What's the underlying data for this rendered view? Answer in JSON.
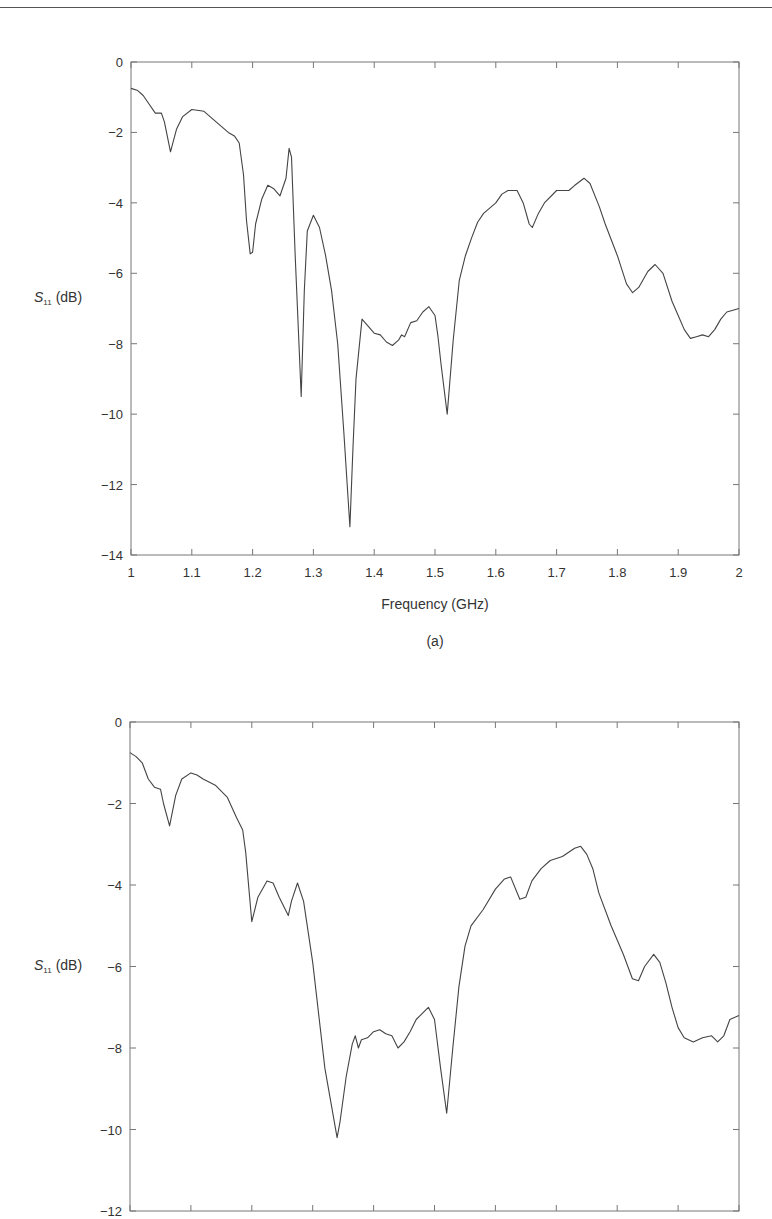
{
  "page": {
    "header_text": "Design for Large Frequency Ratio and Broadband"
  },
  "chart_data": [
    {
      "type": "line",
      "caption": "(a)",
      "title": "",
      "xlabel": "Frequency (GHz)",
      "ylabel": "S11 (dB)",
      "ylabel_main": "S",
      "ylabel_sub": "11",
      "ylabel_unit": "(dB)",
      "xlim": [
        1,
        2
      ],
      "ylim": [
        -14,
        0
      ],
      "grid": false,
      "xticks": [
        "1",
        "1.1",
        "1.2",
        "1.3",
        "1.4",
        "1.5",
        "1.6",
        "1.7",
        "1.8",
        "1.9",
        "2"
      ],
      "yticks": [
        "0",
        "−2",
        "−4",
        "−6",
        "−8",
        "−10",
        "−12",
        "−14"
      ],
      "series": [
        {
          "name": "S11",
          "x": [
            1.0,
            1.01,
            1.02,
            1.03,
            1.04,
            1.05,
            1.055,
            1.065,
            1.075,
            1.085,
            1.1,
            1.12,
            1.14,
            1.16,
            1.17,
            1.178,
            1.185,
            1.19,
            1.196,
            1.2,
            1.205,
            1.215,
            1.225,
            1.235,
            1.245,
            1.255,
            1.26,
            1.264,
            1.27,
            1.275,
            1.28,
            1.285,
            1.29,
            1.3,
            1.31,
            1.32,
            1.33,
            1.34,
            1.35,
            1.36,
            1.365,
            1.37,
            1.38,
            1.39,
            1.4,
            1.41,
            1.42,
            1.43,
            1.44,
            1.445,
            1.45,
            1.46,
            1.47,
            1.48,
            1.49,
            1.5,
            1.505,
            1.51,
            1.52,
            1.53,
            1.54,
            1.55,
            1.56,
            1.57,
            1.58,
            1.6,
            1.61,
            1.62,
            1.635,
            1.645,
            1.655,
            1.66,
            1.67,
            1.68,
            1.7,
            1.71,
            1.72,
            1.73,
            1.745,
            1.755,
            1.77,
            1.78,
            1.8,
            1.815,
            1.825,
            1.835,
            1.85,
            1.862,
            1.875,
            1.89,
            1.9,
            1.91,
            1.92,
            1.93,
            1.94,
            1.95,
            1.96,
            1.97,
            1.98,
            1.99,
            2.0
          ],
          "values": [
            -0.75,
            -0.8,
            -0.95,
            -1.2,
            -1.45,
            -1.45,
            -1.7,
            -2.55,
            -1.9,
            -1.55,
            -1.35,
            -1.4,
            -1.7,
            -2.0,
            -2.1,
            -2.3,
            -3.2,
            -4.5,
            -5.45,
            -5.4,
            -4.6,
            -3.9,
            -3.5,
            -3.6,
            -3.8,
            -3.3,
            -2.45,
            -2.7,
            -5.5,
            -7.5,
            -9.5,
            -6.5,
            -4.8,
            -4.35,
            -4.7,
            -5.5,
            -6.5,
            -8.0,
            -10.5,
            -13.2,
            -11.0,
            -9.0,
            -7.3,
            -7.5,
            -7.7,
            -7.75,
            -7.95,
            -8.05,
            -7.9,
            -7.75,
            -7.8,
            -7.4,
            -7.35,
            -7.1,
            -6.95,
            -7.2,
            -7.8,
            -8.6,
            -10.0,
            -7.9,
            -6.2,
            -5.5,
            -5.0,
            -4.55,
            -4.3,
            -4.0,
            -3.75,
            -3.65,
            -3.65,
            -4.0,
            -4.6,
            -4.7,
            -4.3,
            -4.0,
            -3.65,
            -3.65,
            -3.65,
            -3.5,
            -3.3,
            -3.45,
            -4.1,
            -4.6,
            -5.5,
            -6.3,
            -6.55,
            -6.4,
            -5.95,
            -5.75,
            -6.0,
            -6.8,
            -7.2,
            -7.6,
            -7.85,
            -7.8,
            -7.75,
            -7.8,
            -7.6,
            -7.3,
            -7.1,
            -7.05,
            -7.0
          ]
        }
      ]
    },
    {
      "type": "line",
      "caption": "",
      "title": "",
      "xlabel": "",
      "ylabel": "S11 (dB)",
      "ylabel_main": "S",
      "ylabel_sub": "11",
      "ylabel_unit": "(dB)",
      "xlim": [
        1,
        2
      ],
      "ylim": [
        -12,
        0
      ],
      "grid": false,
      "xticks": [],
      "yticks": [
        "0",
        "−2",
        "−4",
        "−6",
        "−8",
        "−10",
        "−12"
      ],
      "series": [
        {
          "name": "S11",
          "x": [
            1.0,
            1.01,
            1.02,
            1.03,
            1.04,
            1.05,
            1.055,
            1.065,
            1.075,
            1.085,
            1.1,
            1.11,
            1.12,
            1.14,
            1.16,
            1.175,
            1.185,
            1.19,
            1.2,
            1.21,
            1.225,
            1.235,
            1.245,
            1.26,
            1.265,
            1.275,
            1.285,
            1.3,
            1.32,
            1.34,
            1.345,
            1.355,
            1.365,
            1.37,
            1.375,
            1.38,
            1.39,
            1.4,
            1.41,
            1.42,
            1.43,
            1.44,
            1.45,
            1.46,
            1.47,
            1.49,
            1.5,
            1.51,
            1.52,
            1.53,
            1.54,
            1.55,
            1.56,
            1.58,
            1.6,
            1.615,
            1.625,
            1.64,
            1.65,
            1.66,
            1.675,
            1.69,
            1.71,
            1.73,
            1.74,
            1.75,
            1.76,
            1.77,
            1.79,
            1.81,
            1.825,
            1.835,
            1.845,
            1.86,
            1.87,
            1.88,
            1.89,
            1.9,
            1.91,
            1.925,
            1.94,
            1.955,
            1.965,
            1.975,
            1.985,
            2.0
          ],
          "values": [
            -0.75,
            -0.85,
            -1.0,
            -1.4,
            -1.6,
            -1.65,
            -2.0,
            -2.55,
            -1.8,
            -1.4,
            -1.25,
            -1.3,
            -1.4,
            -1.55,
            -1.85,
            -2.35,
            -2.65,
            -3.2,
            -4.9,
            -4.3,
            -3.9,
            -3.95,
            -4.3,
            -4.75,
            -4.4,
            -3.95,
            -4.4,
            -5.9,
            -8.5,
            -10.2,
            -9.8,
            -8.7,
            -7.9,
            -7.7,
            -8.0,
            -7.8,
            -7.75,
            -7.6,
            -7.55,
            -7.65,
            -7.7,
            -8.0,
            -7.85,
            -7.6,
            -7.3,
            -7.0,
            -7.3,
            -8.5,
            -9.6,
            -8.0,
            -6.5,
            -5.5,
            -5.0,
            -4.6,
            -4.1,
            -3.85,
            -3.8,
            -4.35,
            -4.3,
            -3.9,
            -3.6,
            -3.4,
            -3.3,
            -3.1,
            -3.05,
            -3.25,
            -3.6,
            -4.2,
            -5.0,
            -5.7,
            -6.3,
            -6.35,
            -6.0,
            -5.7,
            -5.9,
            -6.4,
            -7.0,
            -7.5,
            -7.75,
            -7.85,
            -7.75,
            -7.7,
            -7.85,
            -7.7,
            -7.3,
            -7.2
          ]
        }
      ]
    }
  ]
}
